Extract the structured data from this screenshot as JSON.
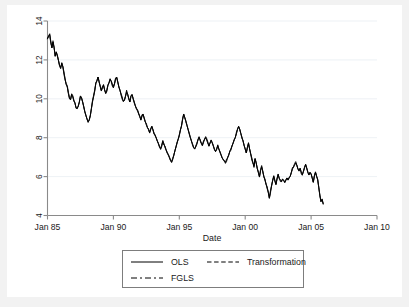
{
  "figure": {
    "background_color": "#f2f2f2",
    "plot_background_color": "#ffffff"
  },
  "chart_data": {
    "type": "line",
    "title": "",
    "xlabel": "Date",
    "ylabel": "",
    "grid": true,
    "legend_position": "bottom",
    "xlim": [
      1985.0,
      2010.0
    ],
    "ylim": [
      4,
      14
    ],
    "yticks": [
      4,
      6,
      8,
      10,
      12,
      14
    ],
    "ytick_labels": [
      "4",
      "6",
      "8",
      "10",
      "12",
      "14"
    ],
    "xticks": [
      1985,
      1990,
      1995,
      2000,
      2005,
      2010
    ],
    "xtick_labels": [
      "Jan 85",
      "Jan 90",
      "Jan 95",
      "Jan 00",
      "Jan 05",
      "Jan 10"
    ],
    "x_start": 1985.0,
    "x_step": 0.08333333,
    "series": [
      {
        "name": "OLS",
        "style": "solid",
        "color": "#000000",
        "values": [
          13.08,
          13.23,
          13.32,
          12.91,
          12.62,
          12.92,
          12.62,
          12.19,
          12.42,
          12.19,
          11.98,
          11.72,
          11.58,
          11.86,
          11.66,
          11.32,
          11.03,
          10.76,
          10.62,
          10.28,
          10.02,
          9.98,
          10.22,
          10.12,
          9.93,
          9.76,
          9.55,
          9.48,
          9.62,
          9.86,
          10.12,
          10.02,
          9.82,
          9.58,
          9.32,
          9.12,
          8.98,
          8.82,
          8.92,
          9.12,
          9.52,
          9.88,
          10.12,
          10.42,
          10.78,
          10.92,
          11.12,
          10.88,
          10.62,
          10.42,
          10.58,
          10.72,
          10.46,
          10.28,
          10.42,
          10.68,
          10.82,
          11.02,
          10.92,
          10.72,
          10.58,
          10.78,
          11.06,
          11.12,
          10.86,
          10.62,
          10.42,
          10.22,
          10.04,
          9.88,
          9.92,
          10.12,
          10.38,
          10.22,
          10.02,
          9.84,
          10.12,
          10.22,
          10.02,
          9.82,
          9.62,
          9.52,
          9.42,
          9.22,
          9.08,
          8.92,
          9.12,
          9.22,
          9.02,
          8.82,
          8.68,
          8.52,
          8.42,
          8.28,
          8.42,
          8.58,
          8.42,
          8.22,
          8.12,
          7.98,
          7.82,
          7.68,
          7.52,
          7.42,
          7.62,
          7.82,
          7.68,
          7.52,
          7.38,
          7.22,
          7.12,
          6.98,
          6.82,
          6.72,
          6.92,
          7.12,
          7.32,
          7.52,
          7.72,
          7.92,
          8.12,
          8.38,
          8.62,
          8.92,
          9.22,
          9.02,
          8.82,
          8.62,
          8.42,
          8.22,
          8.02,
          7.82,
          7.68,
          7.52,
          7.42,
          7.58,
          7.72,
          7.88,
          8.02,
          7.88,
          7.72,
          7.62,
          7.78,
          7.92,
          8.02,
          7.88,
          7.72,
          7.58,
          7.72,
          7.88,
          7.72,
          7.58,
          7.42,
          7.28,
          7.42,
          7.58,
          7.42,
          7.28,
          7.12,
          6.98,
          6.88,
          6.78,
          6.72,
          6.82,
          6.98,
          7.12,
          7.28,
          7.42,
          7.58,
          7.72,
          7.88,
          8.02,
          8.22,
          8.42,
          8.58,
          8.42,
          8.22,
          8.02,
          7.82,
          7.62,
          7.42,
          7.22,
          7.52,
          7.72,
          7.42,
          7.18,
          6.92,
          6.72,
          6.52,
          6.92,
          6.72,
          6.42,
          6.22,
          5.98,
          6.32,
          6.52,
          6.28,
          6.02,
          5.82,
          5.62,
          5.42,
          5.22,
          4.92,
          5.22,
          5.52,
          5.82,
          6.02,
          5.82,
          5.62,
          5.92,
          6.12,
          5.92,
          5.82,
          5.72,
          5.88,
          5.82,
          5.72,
          5.82,
          5.92,
          5.82,
          5.92,
          6.02,
          6.22,
          6.42,
          6.52,
          6.62,
          6.72,
          6.58,
          6.42,
          6.28,
          6.42,
          6.22,
          6.12,
          6.28,
          6.48,
          6.62,
          6.42,
          6.22,
          6.08,
          6.22,
          6.12,
          5.92,
          5.72,
          6.02,
          6.22,
          6.02,
          5.82,
          5.42,
          5.02,
          4.72,
          4.82,
          4.62
        ]
      },
      {
        "name": "Transformation",
        "style": "dashed",
        "color": "#000000"
      },
      {
        "name": "FGLS",
        "style": "dash-dot",
        "color": "#000000"
      }
    ]
  },
  "axes": {
    "x_title": "Date",
    "y_tick_labels": [
      "4",
      "6",
      "8",
      "10",
      "12",
      "14"
    ],
    "x_tick_labels": [
      "Jan 85",
      "Jan 90",
      "Jan 95",
      "Jan 00",
      "Jan 05",
      "Jan 10"
    ]
  },
  "legend": {
    "entries": [
      {
        "label": "OLS",
        "style": "solid"
      },
      {
        "label": "Transformation",
        "style": "dashed"
      },
      {
        "label": "FGLS",
        "style": "dash-dot"
      }
    ]
  }
}
